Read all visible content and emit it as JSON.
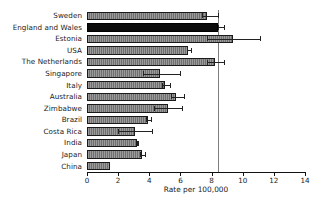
{
  "chart_data": {
    "type": "bar",
    "orientation": "horizontal",
    "title": "",
    "xlabel": "Rate per 100,000",
    "ylabel": "",
    "xlim": [
      0,
      14
    ],
    "xticks": [
      0,
      2,
      4,
      6,
      8,
      10,
      12,
      14
    ],
    "xticklabels": [
      "0",
      "2",
      "4",
      "6",
      "8",
      "10",
      "12",
      "14"
    ],
    "grid": false,
    "legend": "none",
    "reference_line": {
      "value": 8.4,
      "color": "#7d7d7d",
      "label": ""
    },
    "categories": [
      "Sweden",
      "England and Wales",
      "Estonia",
      "USA",
      "The Netherlands",
      "Singapore",
      "Italy",
      "Australia",
      "Zimbabwe",
      "Brazil",
      "Costa Rica",
      "India",
      "Japan",
      "China"
    ],
    "values": [
      7.7,
      8.4,
      9.4,
      6.5,
      8.2,
      4.7,
      5.0,
      5.7,
      5.2,
      3.9,
      3.1,
      3.2,
      3.5,
      1.5
    ],
    "err_low": [
      7.4,
      8.4,
      7.7,
      6.4,
      7.7,
      3.6,
      4.8,
      5.4,
      4.3,
      3.8,
      2.0,
      3.2,
      3.4,
      1.5
    ],
    "err_high": [
      8.4,
      8.8,
      11.1,
      6.7,
      8.8,
      6.0,
      5.3,
      6.2,
      6.1,
      4.1,
      4.2,
      3.3,
      3.7,
      1.5
    ],
    "highlight_index": 1,
    "bar_color": "#6f6f6f",
    "highlight_color": "#0b0b0b",
    "edge_color": "#1a1a1a"
  }
}
